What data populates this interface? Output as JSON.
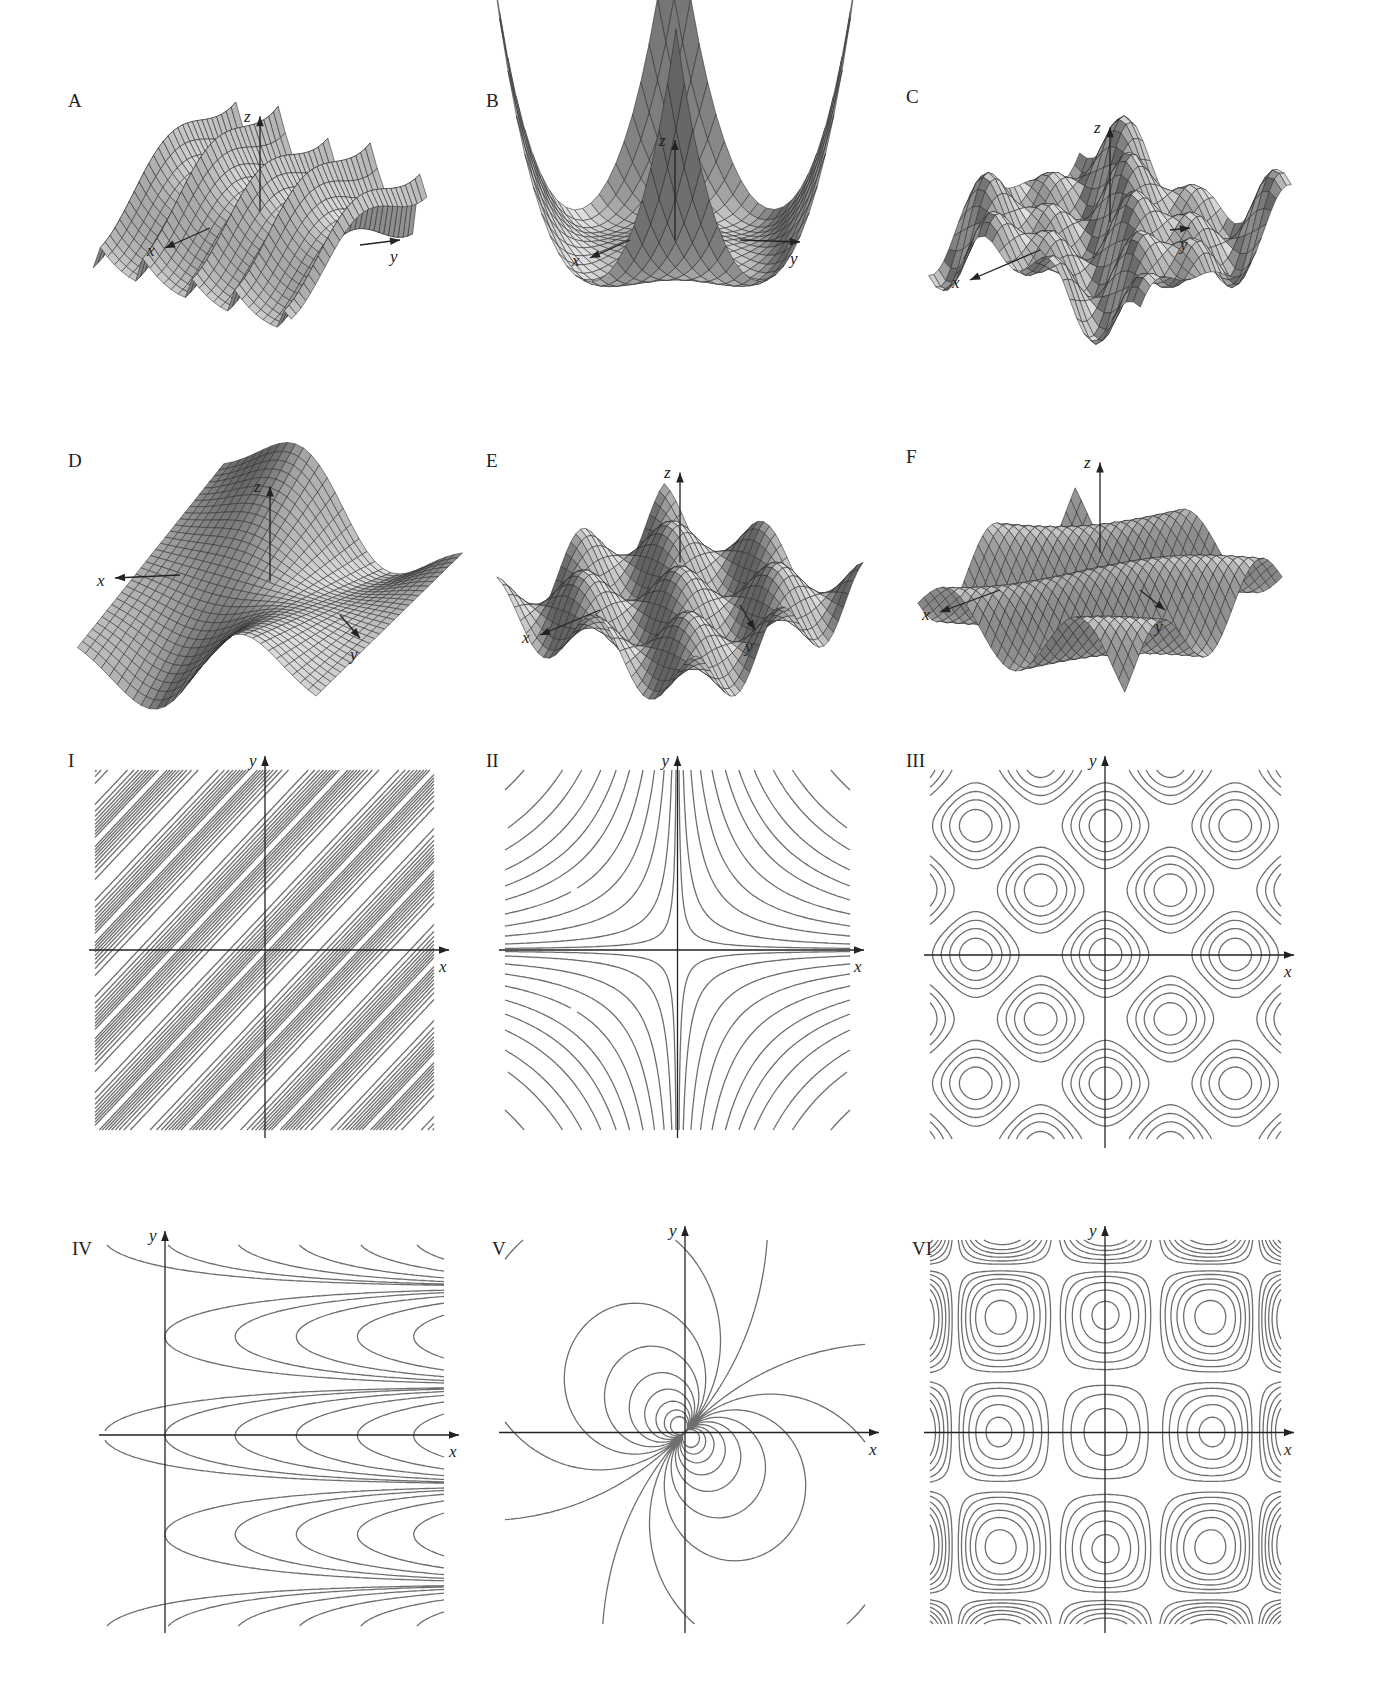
{
  "figure": {
    "surfaces": [
      {
        "id": "A",
        "label": "A",
        "axes": {
          "x": "x",
          "y": "y",
          "z": "z"
        }
      },
      {
        "id": "B",
        "label": "B",
        "axes": {
          "x": "x",
          "y": "y",
          "z": "z"
        }
      },
      {
        "id": "C",
        "label": "C",
        "axes": {
          "x": "x",
          "y": "y",
          "z": "z"
        }
      },
      {
        "id": "D",
        "label": "D",
        "axes": {
          "x": "x",
          "y": "y",
          "z": "z"
        }
      },
      {
        "id": "E",
        "label": "E",
        "axes": {
          "x": "x",
          "y": "y",
          "z": "z"
        }
      },
      {
        "id": "F",
        "label": "F",
        "axes": {
          "x": "x",
          "y": "y",
          "z": "z"
        }
      }
    ],
    "contour_maps": [
      {
        "id": "I",
        "label": "I",
        "axes": {
          "x": "x",
          "y": "y"
        }
      },
      {
        "id": "II",
        "label": "II",
        "axes": {
          "x": "x",
          "y": "y"
        }
      },
      {
        "id": "III",
        "label": "III",
        "axes": {
          "x": "x",
          "y": "y"
        }
      },
      {
        "id": "IV",
        "label": "IV",
        "axes": {
          "x": "x",
          "y": "y"
        }
      },
      {
        "id": "V",
        "label": "V",
        "axes": {
          "x": "x",
          "y": "y"
        }
      },
      {
        "id": "VI",
        "label": "VI",
        "axes": {
          "x": "x",
          "y": "y"
        }
      }
    ]
  },
  "colors": {
    "background": "#ffffff",
    "axis": "#222222",
    "contour_line": "#6e6e6e",
    "surface_mesh": "#2a2a2a",
    "surface_light": "#d6d6d6",
    "surface_dark": "#6a6a6a"
  }
}
